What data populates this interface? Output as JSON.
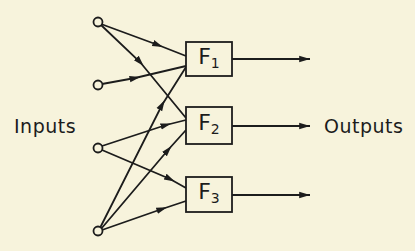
{
  "diagram": {
    "labels": {
      "inputs": "Inputs",
      "outputs": "Outputs"
    },
    "functions": [
      {
        "id": "F1",
        "letter": "F",
        "subscript": "1"
      },
      {
        "id": "F2",
        "letter": "F",
        "subscript": "2"
      },
      {
        "id": "F3",
        "letter": "F",
        "subscript": "3"
      }
    ],
    "input_nodes": 4,
    "connections": [
      {
        "from": "input1",
        "to": "F1"
      },
      {
        "from": "input1",
        "to": "F2"
      },
      {
        "from": "input2",
        "to": "F1"
      },
      {
        "from": "input3",
        "to": "F2"
      },
      {
        "from": "input3",
        "to": "F3"
      },
      {
        "from": "input4",
        "to": "F1"
      },
      {
        "from": "input4",
        "to": "F2"
      },
      {
        "from": "input4",
        "to": "F3"
      }
    ],
    "colors": {
      "background": "#f7f3dc",
      "ink": "#1c1c1c"
    }
  }
}
